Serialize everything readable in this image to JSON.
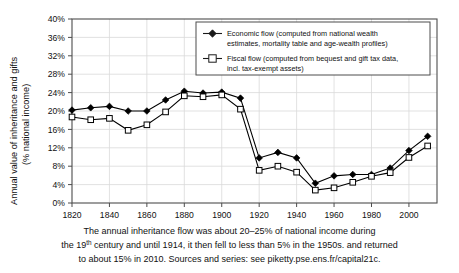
{
  "chart_data": {
    "type": "line",
    "title": "",
    "xlabel": "",
    "ylabel": "Annual value of inheritance and gifts (% national income)",
    "ylabel_line1": "Annual value of inheritance and gifts",
    "ylabel_line2": "(% national income)",
    "x": [
      1820,
      1830,
      1840,
      1850,
      1860,
      1870,
      1880,
      1890,
      1900,
      1910,
      1920,
      1930,
      1940,
      1950,
      1960,
      1970,
      1980,
      1990,
      2000,
      2010
    ],
    "xlim": [
      1820,
      2015
    ],
    "ylim": [
      0,
      40
    ],
    "xticks": [
      "1820",
      "1840",
      "1860",
      "1880",
      "1900",
      "1920",
      "1940",
      "1960",
      "1980",
      "2000"
    ],
    "xtick_values": [
      1820,
      1840,
      1860,
      1880,
      1900,
      1920,
      1940,
      1960,
      1980,
      2000
    ],
    "yticks": [
      "0%",
      "4%",
      "8%",
      "12%",
      "16%",
      "20%",
      "24%",
      "28%",
      "32%",
      "36%",
      "40%"
    ],
    "ytick_values": [
      0,
      4,
      8,
      12,
      16,
      20,
      24,
      28,
      32,
      36,
      40
    ],
    "grid": true,
    "legend_position": "top-right",
    "series": [
      {
        "name": "Economic flow (computed from national wealth estimates, mortality table and age-wealth profiles)",
        "legend_line1": "Economic flow (computed from national wealth",
        "legend_line2": "estimates, mortality table and age-wealth profiles)",
        "marker": "filled-diamond",
        "color": "#000000",
        "values": [
          20.2,
          20.7,
          21.0,
          20.0,
          20.0,
          22.4,
          24.3,
          23.9,
          24.1,
          22.8,
          9.8,
          11.0,
          9.8,
          4.3,
          5.9,
          6.2,
          6.2,
          7.6,
          11.4,
          14.5
        ]
      },
      {
        "name": "Fiscal flow (computed from bequest and gift tax data, incl. tax-exempt assets)",
        "legend_line1": "Fiscal flow (computed from bequest and gift tax data,",
        "legend_line2": "incl. tax-exempt assets)",
        "marker": "open-square",
        "color": "#000000",
        "values": [
          18.7,
          18.1,
          18.4,
          15.8,
          17.0,
          19.8,
          23.3,
          23.1,
          23.5,
          20.4,
          7.1,
          8.0,
          6.7,
          2.8,
          3.3,
          4.5,
          5.8,
          6.6,
          9.9,
          12.4
        ]
      }
    ]
  },
  "caption": {
    "line1": "The annual inheritance flow was about 20–25% of national income during",
    "line2_a": "the 19",
    "line2_sup": "th",
    "line2_b": " century and until 1914, it then fell to less than 5% in the 1950s. and returned",
    "line3": "to about 15% in 2010. Sources and series: see piketty.pse.ens.fr/capital21c."
  },
  "colors": {
    "frame": "#4d4d4d",
    "grid": "#d9d9d9",
    "line": "#1a1a1a",
    "background": "#ffffff"
  }
}
